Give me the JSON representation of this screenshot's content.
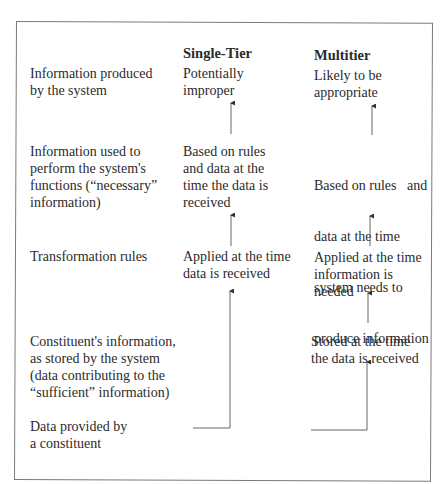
{
  "diagram": {
    "type": "comparison-flow",
    "columns": {
      "single_tier": "Single-Tier",
      "multitier": "Multitier"
    },
    "rows": [
      {
        "label": [
          "Information produced",
          "by the system"
        ],
        "single_tier": [
          "Potentially",
          "improper"
        ],
        "multitier": [
          "Likely to be",
          "appropriate"
        ]
      },
      {
        "label": [
          "Information used to",
          "perform the system's",
          "functions (“necessary”",
          "information)"
        ],
        "single_tier": [
          "Based on rules",
          "and data at the",
          "time the data is",
          "received"
        ],
        "multitier": [
          "Based on rules   and",
          "data at the time",
          "system needs to",
          "produce information"
        ]
      },
      {
        "label": [
          "Transformation rules"
        ],
        "single_tier": [
          "Applied at the time",
          "data is received"
        ],
        "multitier": [
          "Applied at the time",
          "information is",
          "needed"
        ]
      },
      {
        "label": [
          "Constituent's information,",
          "as stored by the system",
          "(data contributing to the",
          "“sufficient” information)"
        ],
        "single_tier": [],
        "multitier": [
          "Stored at the time",
          "the data is received"
        ]
      },
      {
        "label": [
          "Data provided by",
          "a constituent"
        ],
        "single_tier": [],
        "multitier": []
      }
    ],
    "flows": {
      "single_tier": [
        "Data provided by a constituent",
        "Applied at the time data is received",
        "Based on rules and data at the time the data is received",
        "Potentially improper"
      ],
      "multitier": [
        "Data provided by a constituent",
        "Stored at the time the data is received",
        "Applied at the time information is needed",
        "Based on rules and data at the time system needs to produce information",
        "Likely to be appropriate"
      ]
    },
    "colors": {
      "text": "#2b2b2b",
      "lines": "#7a7a7a",
      "arrows": "#555555"
    }
  }
}
